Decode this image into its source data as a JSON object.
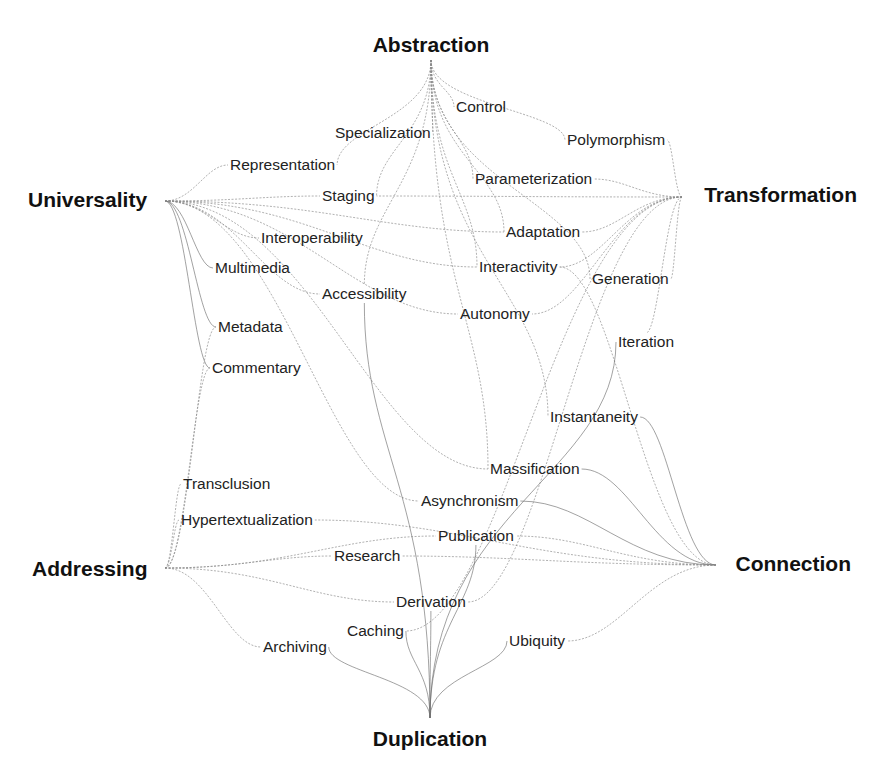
{
  "diagram": {
    "type": "concept-network",
    "colors": {
      "hub_text": "#111111",
      "leaf_text": "#222222",
      "edge": "#8a8a8a",
      "background": "#ffffff"
    },
    "hubs": [
      {
        "id": "abstraction",
        "label": "Abstraction",
        "x": 431,
        "y": 52,
        "anchor": "middle",
        "port": [
          431,
          60
        ]
      },
      {
        "id": "universality",
        "label": "Universality",
        "x": 28,
        "y": 207,
        "anchor": "start",
        "port": [
          165,
          201
        ]
      },
      {
        "id": "transformation",
        "label": "Transformation",
        "x": 857,
        "y": 202,
        "anchor": "end",
        "port": [
          682,
          197
        ]
      },
      {
        "id": "addressing",
        "label": "Addressing",
        "x": 32,
        "y": 576,
        "anchor": "start",
        "port": [
          165,
          568
        ]
      },
      {
        "id": "connection",
        "label": "Connection",
        "x": 851,
        "y": 571,
        "anchor": "end",
        "port": [
          716,
          565
        ]
      },
      {
        "id": "duplication",
        "label": "Duplication",
        "x": 430,
        "y": 746,
        "anchor": "middle",
        "port": [
          430,
          718
        ]
      }
    ],
    "leaves": [
      {
        "id": "control",
        "label": "Control",
        "x": 456,
        "y": 112
      },
      {
        "id": "specialization",
        "label": "Specialization",
        "x": 335,
        "y": 138
      },
      {
        "id": "polymorphism",
        "label": "Polymorphism",
        "x": 567,
        "y": 145
      },
      {
        "id": "representation",
        "label": "Representation",
        "x": 230,
        "y": 170
      },
      {
        "id": "parameterization",
        "label": "Parameterization",
        "x": 475,
        "y": 184
      },
      {
        "id": "staging",
        "label": "Staging",
        "x": 322,
        "y": 201
      },
      {
        "id": "adaptation",
        "label": "Adaptation",
        "x": 506,
        "y": 237
      },
      {
        "id": "interoperability",
        "label": "Interoperability",
        "x": 261,
        "y": 243
      },
      {
        "id": "multimedia",
        "label": "Multimedia",
        "x": 215,
        "y": 273
      },
      {
        "id": "interactivity",
        "label": "Interactivity",
        "x": 479,
        "y": 272
      },
      {
        "id": "generation",
        "label": "Generation",
        "x": 592,
        "y": 284
      },
      {
        "id": "accessibility",
        "label": "Accessibility",
        "x": 322,
        "y": 299
      },
      {
        "id": "autonomy",
        "label": "Autonomy",
        "x": 460,
        "y": 319
      },
      {
        "id": "metadata",
        "label": "Metadata",
        "x": 218,
        "y": 332
      },
      {
        "id": "iteration",
        "label": "Iteration",
        "x": 618,
        "y": 347
      },
      {
        "id": "commentary",
        "label": "Commentary",
        "x": 212,
        "y": 373
      },
      {
        "id": "instantaneity",
        "label": "Instantaneity",
        "x": 550,
        "y": 422
      },
      {
        "id": "massification",
        "label": "Massification",
        "x": 490,
        "y": 474
      },
      {
        "id": "transclusion",
        "label": "Transclusion",
        "x": 183,
        "y": 489
      },
      {
        "id": "asynchronism",
        "label": "Asynchronism",
        "x": 421,
        "y": 506
      },
      {
        "id": "hypertextualization",
        "label": "Hypertextualization",
        "x": 181,
        "y": 525
      },
      {
        "id": "publication",
        "label": "Publication",
        "x": 438,
        "y": 541
      },
      {
        "id": "research",
        "label": "Research",
        "x": 334,
        "y": 561
      },
      {
        "id": "derivation",
        "label": "Derivation",
        "x": 396,
        "y": 607
      },
      {
        "id": "caching",
        "label": "Caching",
        "x": 347,
        "y": 636
      },
      {
        "id": "ubiquity",
        "label": "Ubiquity",
        "x": 509,
        "y": 646
      },
      {
        "id": "archiving",
        "label": "Archiving",
        "x": 263,
        "y": 652
      }
    ],
    "edges": [
      [
        "abstraction",
        "control"
      ],
      [
        "abstraction",
        "specialization"
      ],
      [
        "abstraction",
        "polymorphism"
      ],
      [
        "abstraction",
        "representation"
      ],
      [
        "abstraction",
        "parameterization"
      ],
      [
        "abstraction",
        "staging"
      ],
      [
        "abstraction",
        "adaptation"
      ],
      [
        "abstraction",
        "interactivity"
      ],
      [
        "abstraction",
        "accessibility"
      ],
      [
        "abstraction",
        "instantaneity"
      ],
      [
        "abstraction",
        "massification"
      ],
      [
        "abstraction",
        "generation"
      ],
      [
        "universality",
        "representation"
      ],
      [
        "universality",
        "staging"
      ],
      [
        "universality",
        "interoperability"
      ],
      [
        "universality",
        "multimedia"
      ],
      [
        "universality",
        "accessibility"
      ],
      [
        "universality",
        "metadata"
      ],
      [
        "universality",
        "commentary"
      ],
      [
        "universality",
        "adaptation"
      ],
      [
        "universality",
        "interactivity"
      ],
      [
        "universality",
        "autonomy"
      ],
      [
        "universality",
        "asynchronism"
      ],
      [
        "universality",
        "massification"
      ],
      [
        "transformation",
        "polymorphism"
      ],
      [
        "transformation",
        "parameterization"
      ],
      [
        "transformation",
        "adaptation"
      ],
      [
        "transformation",
        "interactivity"
      ],
      [
        "transformation",
        "generation"
      ],
      [
        "transformation",
        "autonomy"
      ],
      [
        "transformation",
        "iteration"
      ],
      [
        "transformation",
        "staging"
      ],
      [
        "transformation",
        "derivation"
      ],
      [
        "transformation",
        "caching"
      ],
      [
        "addressing",
        "transclusion"
      ],
      [
        "addressing",
        "hypertextualization"
      ],
      [
        "addressing",
        "research"
      ],
      [
        "addressing",
        "publication"
      ],
      [
        "addressing",
        "derivation"
      ],
      [
        "addressing",
        "archiving"
      ],
      [
        "addressing",
        "metadata"
      ],
      [
        "addressing",
        "commentary"
      ],
      [
        "connection",
        "instantaneity"
      ],
      [
        "connection",
        "massification"
      ],
      [
        "connection",
        "asynchronism"
      ],
      [
        "connection",
        "publication"
      ],
      [
        "connection",
        "research"
      ],
      [
        "connection",
        "ubiquity"
      ],
      [
        "connection",
        "interactivity"
      ],
      [
        "connection",
        "hypertextualization"
      ],
      [
        "duplication",
        "archiving"
      ],
      [
        "duplication",
        "caching"
      ],
      [
        "duplication",
        "derivation"
      ],
      [
        "duplication",
        "ubiquity"
      ],
      [
        "duplication",
        "publication"
      ],
      [
        "duplication",
        "iteration"
      ],
      [
        "duplication",
        "accessibility"
      ]
    ]
  }
}
